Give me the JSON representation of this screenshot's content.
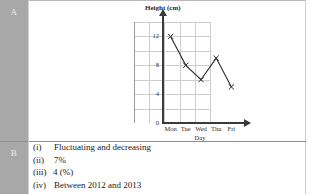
{
  "rows": {
    "a_label": "A",
    "b_label": "B"
  },
  "chart_data": {
    "type": "line",
    "title": "",
    "ylabel": "Height (cm)",
    "xlabel": "Day",
    "categories": [
      "Mon",
      "Tue",
      "Wed",
      "Thu",
      "Fri"
    ],
    "values": [
      12,
      8,
      6,
      9,
      5
    ],
    "yticks": [
      "0",
      "4",
      "8",
      "12"
    ],
    "ytick_values": [
      0,
      4,
      8,
      12
    ],
    "ylim": [
      0,
      14
    ],
    "grid": true,
    "legend": "none",
    "marker": "x-cross",
    "line_color": "#2b2b2b"
  },
  "answers": [
    {
      "num": "(i)",
      "text": "Fluctuating and decreasing"
    },
    {
      "num": "(ii)",
      "text": "7%"
    },
    {
      "num": "(iii)",
      "text": "4 (%)"
    },
    {
      "num": "(iv)",
      "text": "Between 2012 and 2013"
    }
  ]
}
